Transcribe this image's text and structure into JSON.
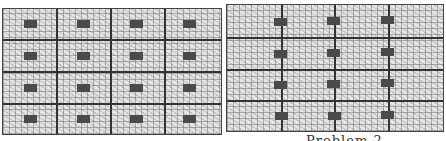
{
  "figure": {
    "caption_visible": "Problem 2",
    "panels": [
      {
        "id": "left",
        "rows": 4,
        "cols": 4,
        "blocks_per_cell": 1,
        "block_placement": "centered in each cell",
        "block_color": "#4a4a4a",
        "fill": "hatched grey"
      },
      {
        "id": "right",
        "rows": 4,
        "interior_vertical_lines": 3,
        "blocks_per_row": 3,
        "block_placement": "straddling vertical lines",
        "block_color": "#4a4a4a",
        "fill": "hatched grey"
      }
    ]
  }
}
